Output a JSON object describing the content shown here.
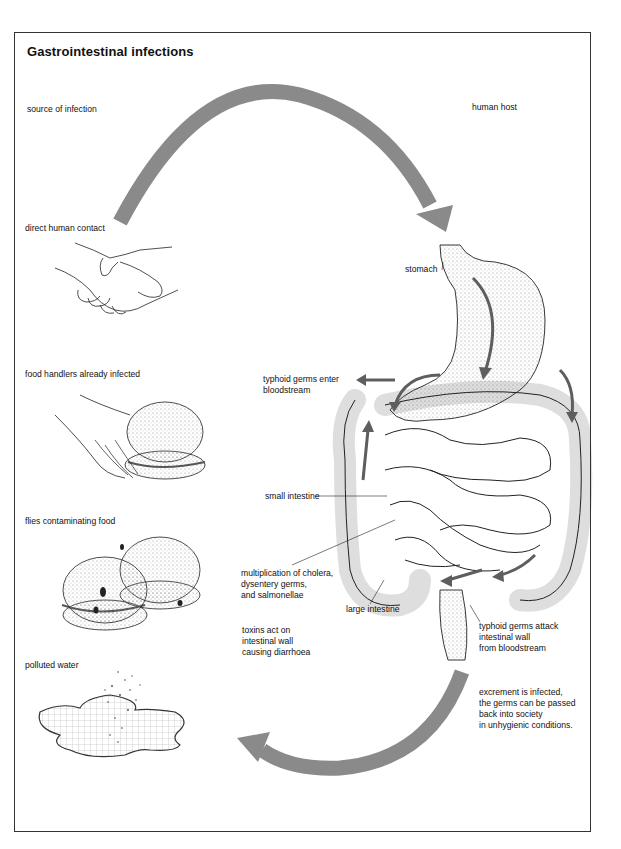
{
  "title": "Gastrointestinal infections",
  "colors": {
    "arrow": "#8a8a8a",
    "organ_arrow": "#5e5e5e",
    "line": "#222222",
    "stipple": "#9a9a9a",
    "background": "#ffffff"
  },
  "columns": {
    "left_heading": "source of infection",
    "right_heading": "human host"
  },
  "sources": [
    {
      "label": "direct human contact",
      "icon": "handshake-icon"
    },
    {
      "label": "food handlers already infected",
      "icon": "hand-holding-burger-icon"
    },
    {
      "label": "flies contaminating food",
      "icon": "flies-on-burgers-icon"
    },
    {
      "label": "polluted water",
      "icon": "polluted-water-puddle-icon"
    }
  ],
  "host_labels": {
    "stomach": "stomach",
    "typhoid_enter": [
      "typhoid germs enter",
      "bloodstream"
    ],
    "small_intestine": "small intestine",
    "multiplication": [
      "multiplication of cholera,",
      "dysentery germs,",
      "and  salmonellae"
    ],
    "large_intestine": "large intestine",
    "toxins": [
      "toxins act on",
      "intestinal wall",
      "causing diarrhoea"
    ],
    "typhoid_attack": [
      "typhoid germs attack",
      "intestinal wall",
      "from bloodstream"
    ],
    "excrement": [
      "excrement is infected,",
      "the germs can be passed",
      "back into society",
      "in unhygienic conditions."
    ]
  },
  "cycle_arrows": [
    {
      "name": "to-host-arrow",
      "direction": "source to human host"
    },
    {
      "name": "back-to-society-arrow",
      "direction": "human host back to source"
    }
  ]
}
